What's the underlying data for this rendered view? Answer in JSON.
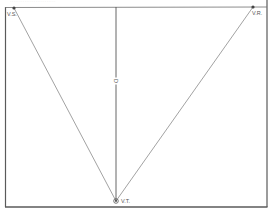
{
  "header": {
    "caption": "·························"
  },
  "diagram": {
    "vertices": [
      {
        "id": "vs",
        "label": "V.S.",
        "x": 14,
        "y": 8
      },
      {
        "id": "vr",
        "label": "V.R.",
        "x": 253,
        "y": 7
      },
      {
        "id": "vt",
        "label": "V.T.",
        "x": 116,
        "y": 201
      }
    ],
    "center_label": "D",
    "colors": {
      "line": "#6e6e6e",
      "frame": "#5a5a5a",
      "point": "#444444"
    }
  }
}
